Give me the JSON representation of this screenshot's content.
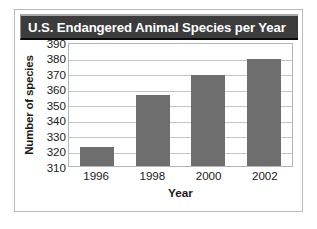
{
  "chart_data": {
    "type": "bar",
    "title": "U.S. Endangered Animal Species per Year",
    "xlabel": "Year",
    "ylabel": "Number of species",
    "categories": [
      "1996",
      "1998",
      "2000",
      "2002"
    ],
    "values": [
      322,
      356,
      369,
      379
    ],
    "ylim": [
      310,
      390
    ],
    "ytick_values": [
      390,
      380,
      370,
      360,
      350,
      340,
      330,
      320,
      310
    ],
    "ytick_labels": [
      "390",
      "380",
      "370",
      "360",
      "350",
      "340",
      "330",
      "320",
      "310"
    ],
    "grid": true,
    "legend": null,
    "bar_color": "#6e6e6e",
    "title_bg_color": "#3c3c3c",
    "title_text_color": "#ffffff",
    "gridline_color": "#c4c4c4",
    "frame_color": "#b9b9b9"
  }
}
